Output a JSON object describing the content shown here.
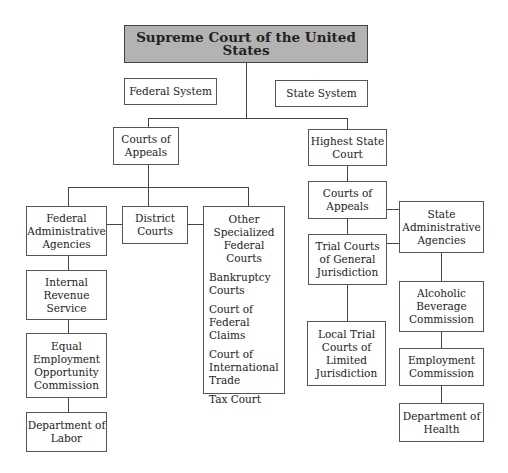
{
  "title": "Supreme Court of the United States",
  "labels": {
    "federal_system": "Federal System",
    "state_system": "State System"
  },
  "federal": {
    "courts_of_appeals": "Courts of\nAppeals",
    "administrative_agencies": "Federal\nAdministrative\nAgencies",
    "district_courts": "District\nCourts",
    "other_specialized": {
      "title": "Other\nSpecialized\nFederal\nCourts",
      "items": [
        "Bankruptcy\nCourts",
        "Court of\nFederal Claims",
        "Court of\nInternational\nTrade",
        "Tax Court"
      ]
    },
    "agencies": [
      "Internal\nRevenue\nService",
      "Equal\nEmployment\nOpportunity\nCommission",
      "Department of\nLabor"
    ]
  },
  "state": {
    "highest_court": "Highest State\nCourt",
    "courts_of_appeals": "Courts of\nAppeals",
    "trial_general": "Trial Courts\nof General\nJurisdiction",
    "trial_limited": "Local Trial\nCourts of\nLimited\nJurisdiction",
    "administrative_agencies": "State\nAdministrative\nAgencies",
    "agencies": [
      "Alcoholic\nBeverage\nCommission",
      "Employment\nCommission",
      "Department of\nHealth"
    ]
  }
}
